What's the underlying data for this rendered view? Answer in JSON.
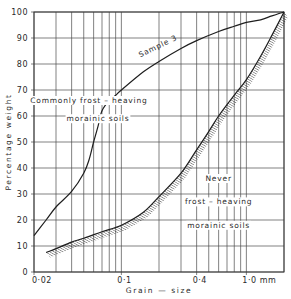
{
  "chart_data": {
    "type": "line",
    "title": "",
    "xlabel": "Grain — size",
    "ylabel": "Percentage weight",
    "xscale": "log",
    "xlim": [
      0.02,
      2.0
    ],
    "ylim": [
      0,
      100
    ],
    "grid": true,
    "x_tick_labels": [
      {
        "value": 0.02,
        "label": "0·02"
      },
      {
        "value": 0.1,
        "label": "0·1"
      },
      {
        "value": 0.4,
        "label": "0·4"
      },
      {
        "value": 1.0,
        "label": "1·0 mm"
      }
    ],
    "x_gridlines": [
      0.02,
      0.03,
      0.04,
      0.05,
      0.06,
      0.07,
      0.08,
      0.09,
      0.1,
      0.2,
      0.3,
      0.4,
      0.5,
      0.6,
      0.7,
      0.8,
      0.9,
      1.0,
      2.0
    ],
    "y_ticks": [
      0,
      10,
      20,
      30,
      40,
      50,
      60,
      70,
      80,
      90,
      100
    ],
    "series": [
      {
        "name": "Sample 3",
        "style": "solid",
        "points": [
          [
            0.02,
            14
          ],
          [
            0.025,
            20
          ],
          [
            0.03,
            25
          ],
          [
            0.04,
            31
          ],
          [
            0.05,
            38
          ],
          [
            0.055,
            43
          ],
          [
            0.06,
            50
          ],
          [
            0.065,
            56
          ],
          [
            0.07,
            62
          ],
          [
            0.08,
            66
          ],
          [
            0.09,
            68
          ],
          [
            0.1,
            70
          ],
          [
            0.15,
            77
          ],
          [
            0.2,
            81
          ],
          [
            0.3,
            86
          ],
          [
            0.4,
            89
          ],
          [
            0.6,
            92.5
          ],
          [
            0.8,
            94.5
          ],
          [
            1.0,
            96
          ],
          [
            1.3,
            97
          ],
          [
            1.6,
            98.5
          ],
          [
            2.0,
            100
          ]
        ]
      },
      {
        "name": "Boundary (frost-heaving limit)",
        "style": "hatched",
        "points": [
          [
            0.025,
            7.5
          ],
          [
            0.03,
            9
          ],
          [
            0.04,
            11.5
          ],
          [
            0.05,
            13
          ],
          [
            0.07,
            15.5
          ],
          [
            0.1,
            18
          ],
          [
            0.15,
            23
          ],
          [
            0.2,
            29
          ],
          [
            0.3,
            38
          ],
          [
            0.4,
            47
          ],
          [
            0.5,
            54
          ],
          [
            0.6,
            60
          ],
          [
            0.8,
            68
          ],
          [
            1.0,
            74
          ],
          [
            1.3,
            83
          ],
          [
            1.6,
            91
          ],
          [
            2.0,
            100
          ]
        ]
      }
    ],
    "annotations": [
      {
        "text": "Sample 3",
        "x": 0.2,
        "y": 86,
        "rotation": -26
      },
      {
        "text": "Commonly frost – heaving",
        "x": 0.055,
        "y": 65
      },
      {
        "text": "morainic  soils",
        "x": 0.065,
        "y": 58
      },
      {
        "text": "Never",
        "x": 0.6,
        "y": 35
      },
      {
        "text": "frost – heaving",
        "x": 0.6,
        "y": 26
      },
      {
        "text": "morainic  soils",
        "x": 0.6,
        "y": 17
      }
    ]
  }
}
